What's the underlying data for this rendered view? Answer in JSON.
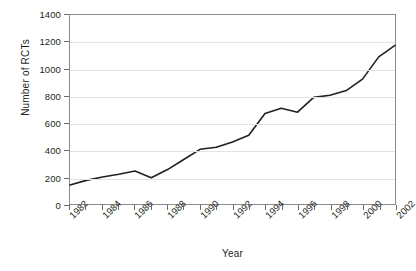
{
  "chart_data": {
    "type": "line",
    "title": "",
    "subtitle": "",
    "xlabel": "Year",
    "ylabel": "Number of RCTs",
    "xlim": [
      1982,
      2002
    ],
    "ylim": [
      0,
      1400
    ],
    "ytick_step": 200,
    "xtick_step": 1,
    "xtick_label_step": 2,
    "grid": "horizontal",
    "legend": "none",
    "line_color": "#231f20",
    "grid_color": "#e2e2e2",
    "frame_color": "#8d8d8d",
    "x": [
      1982,
      1983,
      1984,
      1985,
      1986,
      1987,
      1988,
      1989,
      1990,
      1991,
      1992,
      1993,
      1994,
      1995,
      1996,
      1997,
      1998,
      1999,
      2000,
      2001,
      2002
    ],
    "values": [
      140,
      175,
      200,
      220,
      245,
      195,
      255,
      330,
      405,
      420,
      460,
      510,
      670,
      710,
      680,
      790,
      805,
      840,
      925,
      1090,
      1175
    ],
    "ytick_labels": [
      "0",
      "200",
      "400",
      "600",
      "800",
      "1000",
      "1200",
      "1400"
    ],
    "ytick_values": [
      0,
      200,
      400,
      600,
      800,
      1000,
      1200,
      1400
    ],
    "xtick_values": [
      1982,
      1983,
      1984,
      1985,
      1986,
      1987,
      1988,
      1989,
      1990,
      1991,
      1992,
      1993,
      1994,
      1995,
      1996,
      1997,
      1998,
      1999,
      2000,
      2001,
      2002
    ],
    "xtick_labels_shown": [
      "1982",
      "1984",
      "1986",
      "1988",
      "1990",
      "1992",
      "1994",
      "1996",
      "1998",
      "2000",
      "2002"
    ]
  }
}
